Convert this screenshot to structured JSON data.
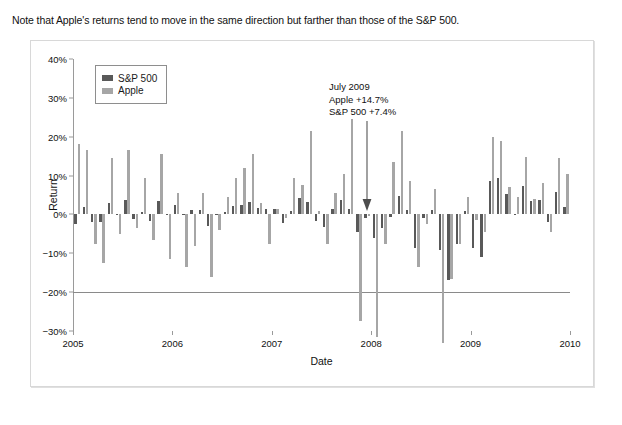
{
  "caption": "Note that Apple's returns tend to move in the same direction but farther than those of the S&P 500.",
  "legend": {
    "items": [
      {
        "label": "S&P 500",
        "color": "#595959"
      },
      {
        "label": "Apple",
        "color": "#a6a6a6"
      }
    ]
  },
  "annotation": {
    "line1": "July 2009",
    "line2": "Apple +14.7%",
    "line3": "S&P 500 +7.4%"
  },
  "chart_data": {
    "type": "bar",
    "title": "",
    "xlabel": "Date",
    "ylabel": "Return",
    "ylim": [
      -30,
      40
    ],
    "ytick_labels": [
      "40%",
      "30%",
      "20%",
      "10%",
      "0%",
      "−10%",
      "−20%",
      "−30%"
    ],
    "ytick_values": [
      40,
      30,
      20,
      10,
      0,
      -10,
      -20,
      -30
    ],
    "xtick_labels": [
      "2005",
      "2006",
      "2007",
      "2008",
      "2009",
      "2010"
    ],
    "xtick_values": [
      2005,
      2006,
      2007,
      2008,
      2009,
      2010
    ],
    "xlim": [
      2005,
      2010
    ],
    "grid": false,
    "legend_position": "upper-left",
    "categories": [
      "2005-01",
      "2005-02",
      "2005-03",
      "2005-04",
      "2005-05",
      "2005-06",
      "2005-07",
      "2005-08",
      "2005-09",
      "2005-10",
      "2005-11",
      "2005-12",
      "2006-01",
      "2006-02",
      "2006-03",
      "2006-04",
      "2006-05",
      "2006-06",
      "2006-07",
      "2006-08",
      "2006-09",
      "2006-10",
      "2006-11",
      "2006-12",
      "2007-01",
      "2007-02",
      "2007-03",
      "2007-04",
      "2007-05",
      "2007-06",
      "2007-07",
      "2007-08",
      "2007-09",
      "2007-10",
      "2007-11",
      "2007-12",
      "2008-01",
      "2008-02",
      "2008-03",
      "2008-04",
      "2008-05",
      "2008-06",
      "2008-07",
      "2008-08",
      "2008-09",
      "2008-10",
      "2008-11",
      "2008-12",
      "2009-01",
      "2009-02",
      "2009-03",
      "2009-04",
      "2009-05",
      "2009-06",
      "2009-07",
      "2009-08",
      "2009-09",
      "2009-10",
      "2009-11",
      "2009-12"
    ],
    "series": [
      {
        "name": "S&P 500",
        "color": "#595959",
        "values": [
          -2.5,
          1.9,
          -1.9,
          -2.0,
          3.0,
          0.0,
          3.6,
          -1.1,
          0.7,
          -1.8,
          3.5,
          -0.1,
          2.5,
          0.0,
          1.1,
          1.2,
          -3.1,
          0.0,
          0.5,
          2.1,
          2.5,
          3.2,
          1.6,
          1.3,
          1.4,
          -2.2,
          1.0,
          4.3,
          3.3,
          -1.8,
          -3.2,
          1.3,
          3.6,
          1.5,
          -4.4,
          -0.9,
          -6.1,
          -3.5,
          -0.6,
          4.8,
          1.1,
          -8.6,
          -1.0,
          1.2,
          -9.1,
          -16.9,
          -7.5,
          0.8,
          -8.6,
          -11.0,
          8.5,
          9.4,
          5.3,
          0.0,
          7.4,
          3.4,
          3.6,
          -2.0,
          5.7,
          1.8
        ]
      },
      {
        "name": "Apple",
        "color": "#a6a6a6",
        "values": [
          18.0,
          16.5,
          -7.5,
          -12.5,
          14.5,
          -5.0,
          16.5,
          -3.5,
          9.5,
          -6.5,
          15.5,
          -11.5,
          5.5,
          -13.5,
          -8.0,
          5.5,
          -16.0,
          -4.0,
          4.5,
          9.5,
          12.0,
          15.5,
          3.0,
          -7.5,
          1.5,
          -1.0,
          9.5,
          7.5,
          21.5,
          1.0,
          -7.5,
          5.5,
          10.5,
          24.5,
          -27.5,
          -0.5,
          -31.5,
          -7.5,
          13.5,
          21.5,
          8.5,
          -13.5,
          -2.5,
          6.5,
          -33.0,
          -16.5,
          -7.5,
          4.5,
          -1.5,
          -4.5,
          20.0,
          19.0,
          7.0,
          4.5,
          14.7,
          4.0,
          8.0,
          -4.5,
          14.5,
          10.5
        ]
      }
    ]
  }
}
